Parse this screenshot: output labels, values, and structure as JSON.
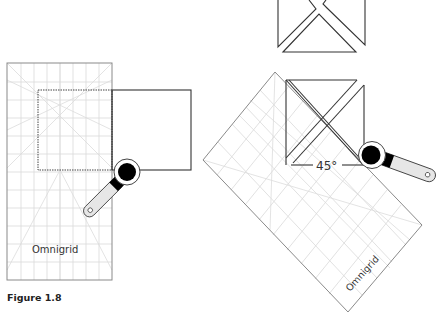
{
  "figure": {
    "caption": "Figure 1.8",
    "ruler_brand_left": "Omnigrid",
    "ruler_brand_right": "Omnigrid",
    "angle_label": "45°"
  },
  "colors": {
    "outline": "#333333",
    "ruler_outline": "#8a8a8a",
    "grid": "#d9d9d9",
    "cutter_body": "#000000",
    "cutter_handle": "#e6e6e6"
  },
  "panels": [
    {
      "name": "left",
      "description": "Square fabric under rectangular ruler with rotary cutter, straight cut"
    },
    {
      "name": "right",
      "description": "Square cut diagonally with ruler rotated 45 degrees, plus result pieces above"
    }
  ]
}
